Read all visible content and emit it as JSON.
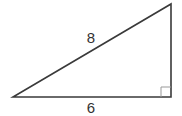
{
  "diagram": {
    "type": "right-triangle",
    "hypotenuse_label": "8",
    "base_label": "6",
    "right_angle_marker": true,
    "colors": {
      "stroke": "#3a3a3a",
      "marker": "#999999",
      "text": "#333333",
      "background": "#ffffff"
    }
  }
}
